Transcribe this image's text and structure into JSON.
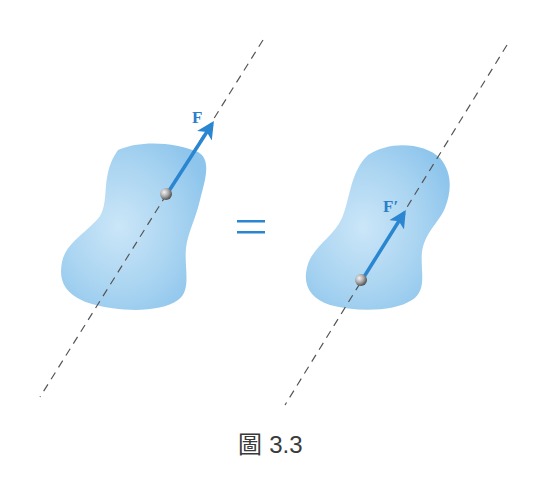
{
  "figure": {
    "caption": "圖 3.3",
    "equals_sign": "=",
    "colors": {
      "body_fill": "#a8d3f0",
      "force_arrow": "#2a86d0",
      "line_of_action": "#555555",
      "label": "#2a7fc8",
      "point": "#9a9a9a"
    },
    "left_panel": {
      "force_label": "F",
      "description": "Force F applied at a point on the rigid body along a dashed line of action"
    },
    "right_panel": {
      "force_label": "F′",
      "description": "Equivalent force F′ applied at a different point on the same line of action"
    }
  }
}
